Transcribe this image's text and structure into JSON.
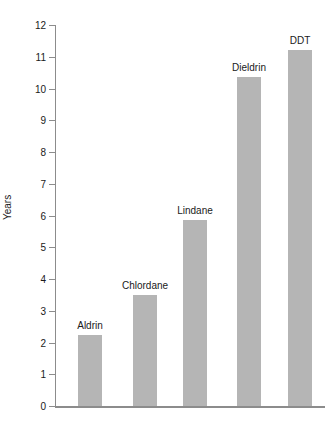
{
  "chart_data": {
    "type": "bar",
    "title": "",
    "xlabel": "",
    "ylabel": "Years",
    "categories": [
      "Aldrin",
      "Chlordane",
      "Lindane",
      "Dieldrin",
      "DDT"
    ],
    "values": [
      2.25,
      3.5,
      5.85,
      10.35,
      11.2
    ],
    "ylim": [
      0,
      12
    ],
    "yticks": [
      0,
      1,
      2,
      3,
      4,
      5,
      6,
      7,
      8,
      9,
      10,
      11,
      12
    ],
    "ytick_labels": [
      "0",
      "1",
      "2",
      "3",
      "4",
      "5",
      "6",
      "7",
      "8",
      "9",
      "10",
      "11",
      "12"
    ],
    "grid": false,
    "legend": "none",
    "bar_color": "#b5b5b5",
    "axis_color": "#8c8c8c",
    "text_color": "#1a1a1a",
    "data_labels_position": "above-bar",
    "points": [
      {
        "category": "Aldrin",
        "value": 2.25
      },
      {
        "category": "Chlordane",
        "value": 3.5
      },
      {
        "category": "Lindane",
        "value": 5.85
      },
      {
        "category": "Dieldrin",
        "value": 10.35
      },
      {
        "category": "DDT",
        "value": 11.2
      }
    ]
  }
}
